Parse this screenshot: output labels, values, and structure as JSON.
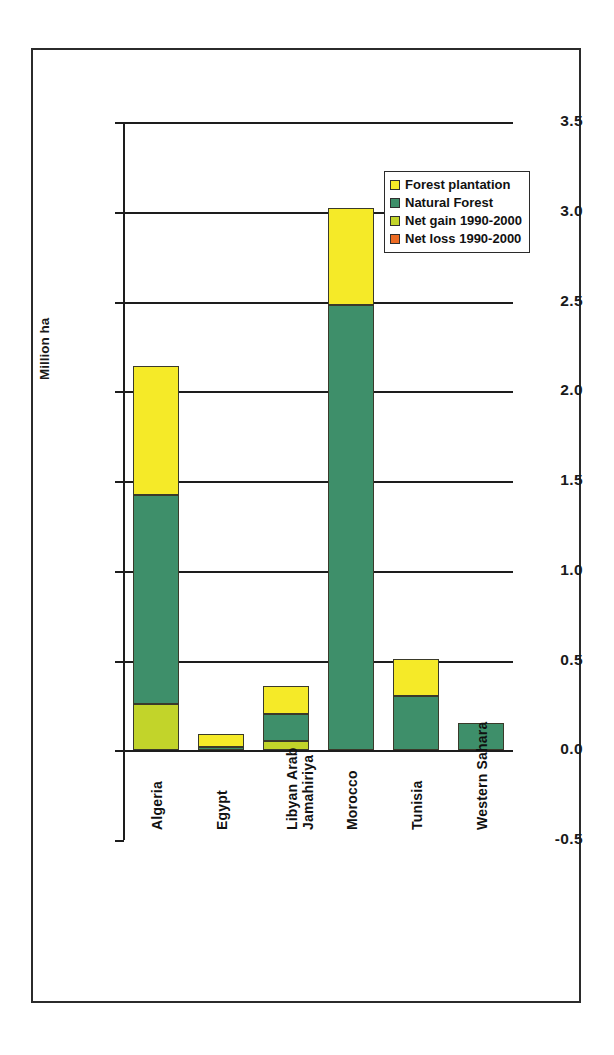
{
  "chart_data": {
    "type": "bar",
    "subtype": "stacked",
    "title": "",
    "xlabel": "",
    "ylabel": "Million ha",
    "ylim": [
      -0.5,
      3.5
    ],
    "yticks": [
      "3.5",
      "3.0",
      "2.5",
      "2.0",
      "1.5",
      "1.0",
      "0.5",
      "0.0",
      "-0.5"
    ],
    "ytick_values": [
      3.5,
      3.0,
      2.5,
      2.0,
      1.5,
      1.0,
      0.5,
      0.0,
      -0.5
    ],
    "grid": true,
    "legend_position": "top-right",
    "categories": [
      "Algeria",
      "Egypt",
      "Libyan Arab Jamahiriya",
      "Morocco",
      "Tunisia",
      "Western Sahara"
    ],
    "category_lines": [
      [
        "Algeria"
      ],
      [
        "Egypt"
      ],
      [
        "Libyan Arab",
        "Jamahiriya"
      ],
      [
        "Morocco"
      ],
      [
        "Tunisia"
      ],
      [
        "Western Sahara"
      ]
    ],
    "series": [
      {
        "name": "Forest plantation",
        "color": "#F5EA28",
        "values": [
          0.72,
          0.07,
          0.16,
          0.54,
          0.21,
          0.0
        ]
      },
      {
        "name": "Natural Forest",
        "color": "#3E8F6A",
        "values": [
          1.16,
          0.02,
          0.15,
          2.48,
          0.3,
          0.15
        ]
      },
      {
        "name": "Net gain 1990-2000",
        "color": "#C2D42A",
        "values": [
          0.26,
          0.0,
          0.05,
          0.0,
          0.0,
          0.0
        ]
      },
      {
        "name": "Net loss 1990-2000",
        "color": "#EC6B23",
        "values": [
          0.0,
          0.0,
          0.0,
          0.0,
          0.0,
          0.0
        ]
      }
    ],
    "totals": [
      2.14,
      0.09,
      0.36,
      3.02,
      0.51,
      0.15
    ],
    "legend": [
      {
        "label": "Forest plantation",
        "color": "#F5EA28"
      },
      {
        "label": "Natural Forest",
        "color": "#3E8F6A"
      },
      {
        "label": "Net gain 1990-2000",
        "color": "#C2D42A"
      },
      {
        "label": "Net loss 1990-2000",
        "color": "#EC6B23"
      }
    ]
  },
  "colors": {
    "axis": "#1d1d1d",
    "frame": "#2b2b2b",
    "background": "#ffffff",
    "forest_plantation": "#F5EA28",
    "natural_forest": "#3E8F6A",
    "net_gain": "#C2D42A",
    "net_loss": "#EC6B23"
  }
}
